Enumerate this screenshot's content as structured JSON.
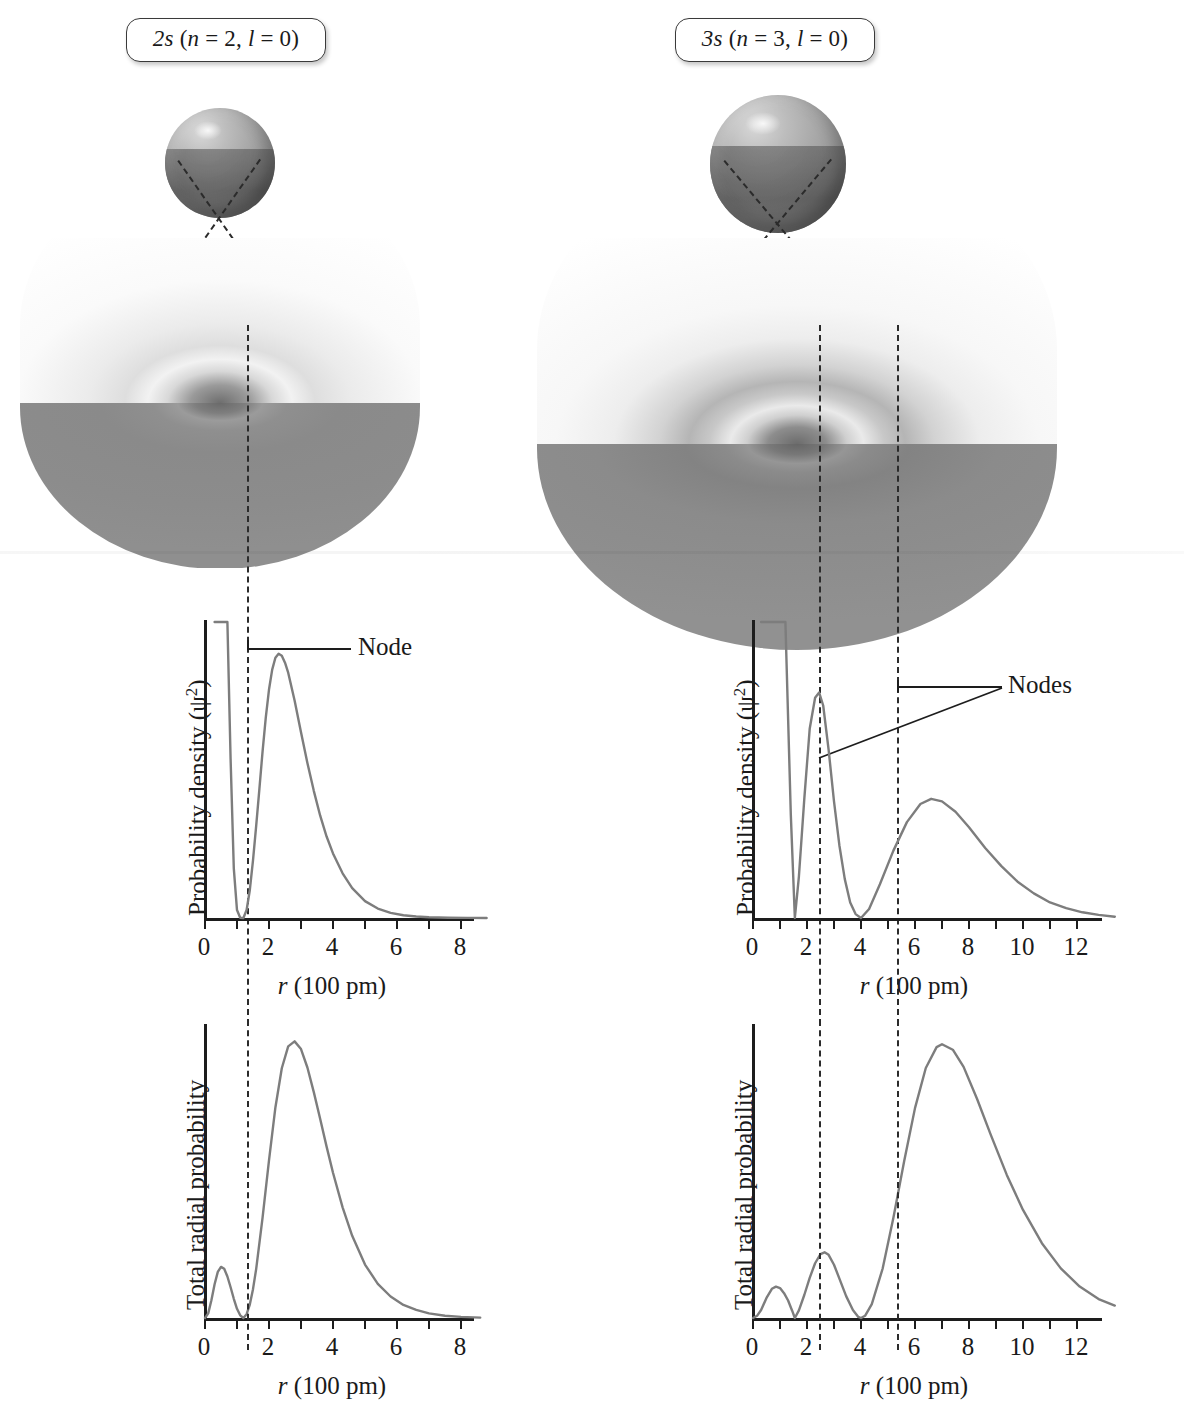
{
  "figure": {
    "xaxis_title": "r (100 pm)",
    "xaxis_title_italic": "r",
    "xaxis_title_rest": " (100 pm)",
    "yaxis_density": "Probability density (ψ",
    "yaxis_density_sup": "2",
    "yaxis_density_tail": ")",
    "yaxis_radial": "Total radial probability"
  },
  "panels": [
    {
      "id": "2s",
      "pill_orbital": "2s",
      "pill_paren_open": " (",
      "pill_n_symbol": "n",
      "pill_n_value": " = 2, ",
      "pill_l_symbol": "l",
      "pill_l_value": " = 0)",
      "pill_full": "2s (n = 2, l = 0)",
      "node_label": "Node",
      "node_count": 1,
      "node_positions": [
        1.2
      ],
      "charts": [
        {
          "kind": "density",
          "type": "line",
          "title": "",
          "xlabel": "r (100 pm)",
          "ylabel": "Probability density (ψ²)",
          "xlim": [
            0,
            9
          ],
          "ylim": [
            0,
            1
          ],
          "xticks": [
            0,
            1,
            2,
            3,
            4,
            5,
            6,
            7,
            8
          ],
          "xticklabels": [
            "0",
            "",
            "2",
            "",
            "4",
            "",
            "6",
            "",
            "8"
          ],
          "grid": false,
          "legend": "none",
          "annotations": [
            {
              "text": "Node",
              "x": 1.2,
              "kind": "node-line"
            }
          ],
          "x": [
            0.3,
            0.4,
            0.5,
            0.6,
            0.7,
            0.8,
            0.9,
            1.0,
            1.1,
            1.2,
            1.3,
            1.4,
            1.5,
            1.6,
            1.7,
            1.8,
            1.9,
            2.0,
            2.1,
            2.2,
            2.3,
            2.4,
            2.5,
            2.6,
            2.8,
            3.0,
            3.2,
            3.4,
            3.6,
            3.8,
            4.0,
            4.3,
            4.6,
            5.0,
            5.4,
            5.8,
            6.2,
            6.6,
            7.0,
            7.6,
            8.2,
            8.8
          ],
          "y": [
            2.6,
            1.7,
            1.1,
            0.66,
            0.36,
            0.16,
            0.05,
            0.008,
            0.0003,
            0.0,
            0.008,
            0.028,
            0.058,
            0.093,
            0.13,
            0.168,
            0.202,
            0.23,
            0.25,
            0.262,
            0.266,
            0.264,
            0.257,
            0.247,
            0.219,
            0.187,
            0.156,
            0.128,
            0.103,
            0.082,
            0.065,
            0.045,
            0.03,
            0.017,
            0.0095,
            0.0052,
            0.0028,
            0.0015,
            0.0008,
            0.0003,
            0.0001,
            0.0
          ]
        },
        {
          "kind": "radial",
          "type": "line",
          "title": "",
          "xlabel": "r (100 pm)",
          "ylabel": "Total radial probability",
          "xlim": [
            0,
            9
          ],
          "ylim": [
            0,
            1
          ],
          "xticks": [
            0,
            1,
            2,
            3,
            4,
            5,
            6,
            7,
            8
          ],
          "xticklabels": [
            "0",
            "",
            "2",
            "",
            "4",
            "",
            "6",
            "",
            "8"
          ],
          "grid": false,
          "legend": "none",
          "annotations": [],
          "x": [
            0.0,
            0.1,
            0.2,
            0.3,
            0.4,
            0.5,
            0.6,
            0.7,
            0.8,
            0.9,
            1.0,
            1.1,
            1.2,
            1.3,
            1.4,
            1.5,
            1.6,
            1.8,
            2.0,
            2.2,
            2.4,
            2.6,
            2.8,
            3.0,
            3.2,
            3.4,
            3.6,
            3.8,
            4.0,
            4.3,
            4.6,
            5.0,
            5.4,
            5.8,
            6.2,
            6.6,
            7.0,
            7.5,
            8.0,
            8.6
          ],
          "y": [
            0.0,
            0.012,
            0.046,
            0.088,
            0.12,
            0.133,
            0.128,
            0.108,
            0.08,
            0.05,
            0.024,
            0.007,
            0.0,
            0.01,
            0.035,
            0.075,
            0.128,
            0.262,
            0.41,
            0.548,
            0.65,
            0.707,
            0.72,
            0.7,
            0.652,
            0.588,
            0.518,
            0.446,
            0.378,
            0.288,
            0.214,
            0.139,
            0.089,
            0.056,
            0.034,
            0.021,
            0.012,
            0.006,
            0.003,
            0.001
          ]
        }
      ]
    },
    {
      "id": "3s",
      "pill_orbital": "3s",
      "pill_paren_open": " (",
      "pill_n_symbol": "n",
      "pill_n_value": " = 3, ",
      "pill_l_symbol": "l",
      "pill_l_value": " = 0)",
      "pill_full": "3s (n = 3, l = 0)",
      "node_label": "Nodes",
      "node_count": 2,
      "node_positions": [
        1.55,
        4.0
      ],
      "charts": [
        {
          "kind": "density",
          "type": "line",
          "title": "",
          "xlabel": "r (100 pm)",
          "ylabel": "Probability density (ψ²)",
          "xlim": [
            0,
            13.5
          ],
          "ylim": [
            0,
            1
          ],
          "xticks": [
            0,
            1,
            2,
            3,
            4,
            5,
            6,
            7,
            8,
            9,
            10,
            11,
            12,
            13
          ],
          "xticklabels": [
            "0",
            "",
            "2",
            "",
            "4",
            "",
            "6",
            "",
            "8",
            "",
            "10",
            "",
            "12",
            ""
          ],
          "grid": false,
          "legend": "none",
          "annotations": [
            {
              "text": "Nodes",
              "x": 1.55,
              "kind": "node-line"
            },
            {
              "text": "Nodes",
              "x": 4.0,
              "kind": "node-line"
            }
          ],
          "x": [
            0.3,
            0.45,
            0.6,
            0.8,
            1.0,
            1.2,
            1.4,
            1.55,
            1.7,
            1.9,
            2.1,
            2.3,
            2.45,
            2.6,
            2.8,
            3.0,
            3.2,
            3.4,
            3.6,
            3.8,
            4.0,
            4.3,
            4.7,
            5.2,
            5.7,
            6.2,
            6.6,
            7.0,
            7.5,
            8.0,
            8.6,
            9.2,
            9.8,
            10.4,
            11.0,
            11.6,
            12.2,
            12.8,
            13.4
          ],
          "y": [
            2.3,
            1.35,
            0.82,
            0.44,
            0.235,
            0.12,
            0.04,
            0.0,
            0.016,
            0.046,
            0.073,
            0.085,
            0.087,
            0.082,
            0.065,
            0.045,
            0.028,
            0.015,
            0.006,
            0.0015,
            0.0,
            0.0035,
            0.013,
            0.026,
            0.037,
            0.044,
            0.046,
            0.045,
            0.041,
            0.035,
            0.027,
            0.02,
            0.014,
            0.0095,
            0.006,
            0.0038,
            0.0022,
            0.0012,
            0.0005
          ]
        },
        {
          "kind": "radial",
          "type": "line",
          "title": "",
          "xlabel": "r (100 pm)",
          "ylabel": "Total radial probability",
          "xlim": [
            0,
            13.5
          ],
          "ylim": [
            0,
            1
          ],
          "xticks": [
            0,
            1,
            2,
            3,
            4,
            5,
            6,
            7,
            8,
            9,
            10,
            11,
            12,
            13
          ],
          "xticklabels": [
            "0",
            "",
            "2",
            "",
            "4",
            "",
            "6",
            "",
            "8",
            "",
            "10",
            "",
            "12",
            ""
          ],
          "grid": false,
          "legend": "none",
          "annotations": [],
          "x": [
            0.0,
            0.15,
            0.3,
            0.5,
            0.7,
            0.85,
            1.0,
            1.15,
            1.3,
            1.45,
            1.55,
            1.7,
            1.9,
            2.1,
            2.3,
            2.5,
            2.65,
            2.8,
            3.0,
            3.2,
            3.45,
            3.7,
            3.9,
            4.0,
            4.15,
            4.4,
            4.8,
            5.2,
            5.6,
            6.0,
            6.4,
            6.8,
            7.0,
            7.4,
            7.8,
            8.3,
            8.8,
            9.4,
            10.0,
            10.7,
            11.4,
            12.1,
            12.8,
            13.4
          ],
          "y": [
            0.0,
            0.006,
            0.022,
            0.055,
            0.08,
            0.086,
            0.082,
            0.068,
            0.048,
            0.02,
            0.0,
            0.021,
            0.063,
            0.11,
            0.15,
            0.175,
            0.18,
            0.173,
            0.146,
            0.108,
            0.06,
            0.022,
            0.003,
            0.0,
            0.006,
            0.038,
            0.135,
            0.275,
            0.43,
            0.575,
            0.685,
            0.742,
            0.75,
            0.735,
            0.688,
            0.6,
            0.503,
            0.392,
            0.296,
            0.205,
            0.136,
            0.086,
            0.052,
            0.034
          ]
        }
      ]
    }
  ]
}
